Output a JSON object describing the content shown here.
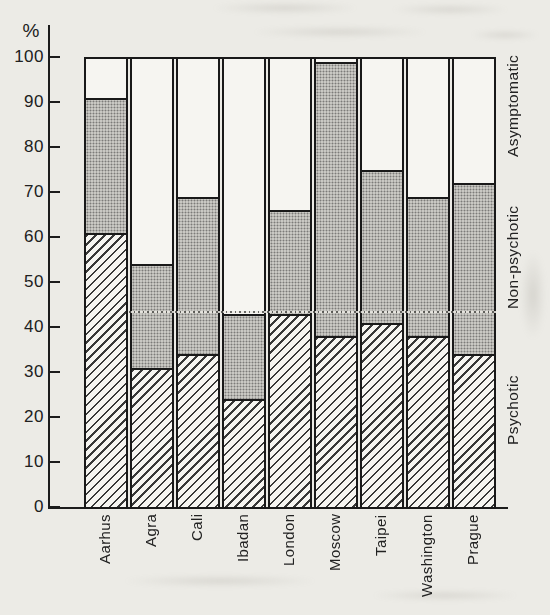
{
  "page": {
    "background": "#ecebe6",
    "ink": "#1c1c1c"
  },
  "chart_data": {
    "type": "bar",
    "stacked": true,
    "orientation": "vertical",
    "title": "",
    "xlabel": "",
    "ylabel": "%",
    "ylim": [
      0,
      100
    ],
    "yticks": [
      0,
      10,
      20,
      30,
      40,
      50,
      60,
      70,
      80,
      90,
      100
    ],
    "grid": false,
    "legend_position": "right-side, rotated 90 degrees",
    "categories": [
      "Aarhus",
      "Agra",
      "Cali",
      "Ibadan",
      "London",
      "Moscow",
      "Taipei",
      "Washington",
      "Prague"
    ],
    "series": [
      {
        "name": "Psychotic",
        "pattern": "diagonal-hatch",
        "fill": "#f6f5f1",
        "values": [
          61,
          31,
          34,
          24,
          43,
          38,
          41,
          38,
          34
        ],
        "cumulative": [
          61,
          31,
          34,
          24,
          43,
          38,
          41,
          38,
          34
        ]
      },
      {
        "name": "Non-psychotic",
        "pattern": "gray-stipple",
        "fill": "#c9c8c3",
        "values": [
          30,
          23,
          35,
          19,
          23,
          61,
          34,
          31,
          38
        ],
        "cumulative": [
          91,
          54,
          69,
          43,
          66,
          99,
          75,
          69,
          72
        ]
      },
      {
        "name": "Asymptomatic",
        "pattern": "plain-white",
        "fill": "#f6f5f1",
        "values": [
          9,
          46,
          31,
          57,
          34,
          1,
          25,
          31,
          28
        ],
        "cumulative": [
          100,
          100,
          100,
          100,
          100,
          100,
          100,
          100,
          100
        ]
      }
    ],
    "reference_line": {
      "value": 43,
      "style": "dotted"
    }
  }
}
